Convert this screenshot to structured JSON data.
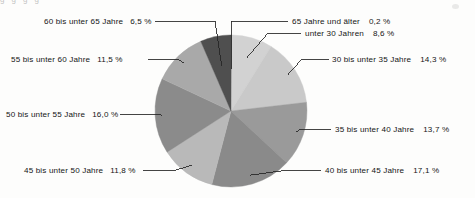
{
  "page": {
    "background_color": "#fdfdfc",
    "cropped_header_text": "g                g                  g                                   g"
  },
  "chart_data": {
    "type": "pie",
    "title": "",
    "subtitle": "",
    "xlabel": "",
    "ylabel": "",
    "legend_position": "outside-labels-with-leader-lines",
    "grid": false,
    "start_angle_deg": 0,
    "direction": "clockwise",
    "units": "%",
    "decimal_separator": ",",
    "categories": [
      "65 Jahre und älter",
      "unter 30 Jahren",
      "30 bis unter 35 Jahre",
      "35 bis unter 40 Jahre",
      "40 bis unter 45 Jahre",
      "45 bis unter 50 Jahre",
      "50 bis unter 55 Jahre",
      "55 bis unter 60 Jahre",
      "60 bis unter 65 Jahre"
    ],
    "values": [
      0.2,
      8.6,
      14.3,
      13.7,
      17.1,
      11.8,
      16.0,
      11.5,
      6.5
    ],
    "value_labels": [
      "0,2 %",
      "8,6 %",
      "14,3 %",
      "13,7 %",
      "17,1 %",
      "11,8 %",
      "16,0 %",
      "11,5 %",
      "6,5 %"
    ],
    "colors": [
      "#6f6f6f",
      "#d2d2d2",
      "#c9c9c9",
      "#9a9a9a",
      "#8a8a8a",
      "#b9b9b9",
      "#8b8b8b",
      "#a9a9a9",
      "#4f4f4f"
    ],
    "slices": [
      {
        "label": "65 Jahre und älter",
        "value": 0.2,
        "value_label": "0,2 %",
        "color": "#6f6f6f"
      },
      {
        "label": "unter 30 Jahren",
        "value": 8.6,
        "value_label": "8,6 %",
        "color": "#d2d2d2"
      },
      {
        "label": "30 bis unter 35 Jahre",
        "value": 14.3,
        "value_label": "14,3 %",
        "color": "#c9c9c9"
      },
      {
        "label": "35 bis unter 40 Jahre",
        "value": 13.7,
        "value_label": "13,7 %",
        "color": "#9a9a9a"
      },
      {
        "label": "40 bis unter 45 Jahre",
        "value": 17.1,
        "value_label": "17,1 %",
        "color": "#8a8a8a"
      },
      {
        "label": "45 bis unter 50 Jahre",
        "value": 11.8,
        "value_label": "11,8 %",
        "color": "#b9b9b9"
      },
      {
        "label": "50 bis unter 55 Jahre",
        "value": 16.0,
        "value_label": "16,0 %",
        "color": "#8b8b8b"
      },
      {
        "label": "55 bis unter 60 Jahre",
        "value": 11.5,
        "value_label": "11,5 %",
        "color": "#a9a9a9"
      },
      {
        "label": "60 bis unter 65 Jahre",
        "value": 6.5,
        "value_label": "6,5 %",
        "color": "#4f4f4f"
      }
    ]
  },
  "labels": {
    "s0": {
      "name": "65 Jahre und älter",
      "pct": "0,2 %"
    },
    "s1": {
      "name": "unter 30 Jahren",
      "pct": "8,6 %"
    },
    "s2": {
      "name": "30 bis unter 35 Jahre",
      "pct": "14,3 %"
    },
    "s3": {
      "name": "35 bis unter 40 Jahre",
      "pct": "13,7 %"
    },
    "s4": {
      "name": "40 bis unter 45 Jahre",
      "pct": "17,1 %"
    },
    "s5": {
      "name": "45 bis unter 50 Jahre",
      "pct": "11,8 %"
    },
    "s6": {
      "name": "50 bis unter 55 Jahre",
      "pct": "16,0 %"
    },
    "s7": {
      "name": "55 bis unter 60 Jahre",
      "pct": "11,5 %"
    },
    "s8": {
      "name": "60 bis unter 65 Jahre",
      "pct": "6,5 %"
    }
  }
}
